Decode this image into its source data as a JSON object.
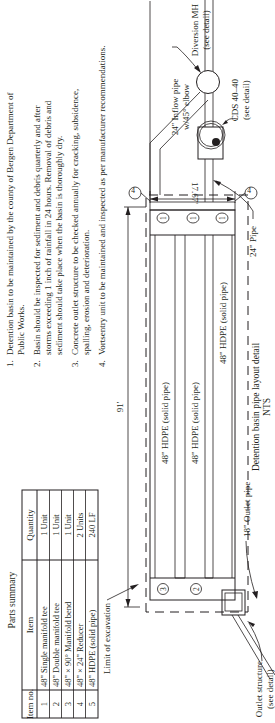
{
  "parts_summary": {
    "title": "Parts summary",
    "headers": [
      "Item no.",
      "Item",
      "Quantity"
    ],
    "rows": [
      {
        "no": "1",
        "item": "48\" Single manifold tee",
        "qty": "1 Unit"
      },
      {
        "no": "2",
        "item": "48\" Double manifold tee",
        "qty": "1 Unit"
      },
      {
        "no": "3",
        "item": "48\" × 90° Manifold bend",
        "qty": "1 Unit"
      },
      {
        "no": "4",
        "item": "48\" × 24\" Reducer",
        "qty": "2 Units"
      },
      {
        "no": "5",
        "item": "48\" HDPE (solid pipe)",
        "qty": "240 LF"
      }
    ]
  },
  "notes": [
    {
      "num": "1.",
      "lines": [
        "Detention basin to be maintained by the county of Bergen Department of",
        "Public Works."
      ]
    },
    {
      "num": "2.",
      "lines": [
        "Basin should be inspected for sediment and debris quarterly and after",
        "storms exceeding 1 inch of rainfall in 24 hours. Removal of debris and",
        "sediment should take place when the basin is thoroughly dry."
      ]
    },
    {
      "num": "3.",
      "lines": [
        "Concrete outlet structure to be checked annually for cracking, subsidence,",
        "spalling, erosion and deterioration."
      ]
    },
    {
      "num": "4.",
      "lines": [
        "Vortsentry unit to be maintained and inspected as per manufacturer recommendations."
      ]
    }
  ],
  "drawing": {
    "length_dim": "91'",
    "width_dim": "17.67'",
    "pipe_labels": [
      "48\" HDPE (solid pipe)",
      "48\" HDPE (solid pipe)",
      "48\" HDPE (solid pipe)"
    ],
    "callouts": {
      "limit_of_excavation": "Limit of excavation",
      "outlet_structure_1": "Outlet structure",
      "outlet_structure_2": "(see detail)",
      "outlet_pipe": "18\" Outlet pipe",
      "inflow_pipe_1": "24\" Inflow pipe",
      "inflow_pipe_2": "w/45° elbow",
      "diversion_mh_1": "Diversion MH",
      "diversion_mh_2": "(see detail)",
      "cds_1": "CDS 40–40",
      "cds_2": "(see detail)",
      "pipe_24": "24\" Pipe"
    },
    "item_tags": {
      "one": "1",
      "two": "2",
      "three": "3",
      "four": "4"
    },
    "caption": "Detention basin pipe layout detail",
    "scale": "NTS"
  }
}
